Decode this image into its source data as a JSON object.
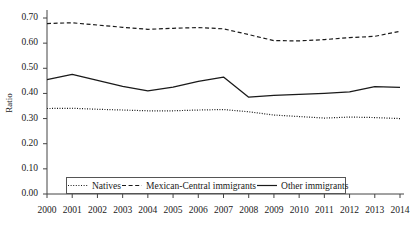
{
  "chart_data": {
    "type": "line",
    "title": "",
    "xlabel": "",
    "ylabel": "Ratio",
    "x": [
      2000,
      2001,
      2002,
      2003,
      2004,
      2005,
      2006,
      2007,
      2008,
      2009,
      2010,
      2011,
      2012,
      2013,
      2014
    ],
    "categories": [
      "2000",
      "2001",
      "2002",
      "2003",
      "2004",
      "2005",
      "2006",
      "2007",
      "2008",
      "2009",
      "2010",
      "2011",
      "2012",
      "2013",
      "2014"
    ],
    "xlim": [
      2000,
      2014
    ],
    "ylim": [
      0.0,
      0.7
    ],
    "yticks": [
      0.0,
      0.1,
      0.2,
      0.3,
      0.4,
      0.5,
      0.6,
      0.7
    ],
    "ytick_labels": [
      "0.00",
      "0.10",
      "0.20",
      "0.30",
      "0.40",
      "0.50",
      "0.60",
      "0.70"
    ],
    "grid": false,
    "legend_position": "bottom-inside",
    "series": [
      {
        "name": "Natives",
        "style": "dotted",
        "color": "#1a1a1a",
        "values": [
          0.34,
          0.341,
          0.337,
          0.334,
          0.331,
          0.331,
          0.334,
          0.336,
          0.327,
          0.314,
          0.308,
          0.302,
          0.306,
          0.304,
          0.3
        ]
      },
      {
        "name": "Mexican-Central immigrants",
        "style": "dashed",
        "color": "#1a1a1a",
        "values": [
          0.678,
          0.681,
          0.672,
          0.663,
          0.655,
          0.659,
          0.662,
          0.657,
          0.634,
          0.61,
          0.609,
          0.614,
          0.622,
          0.627,
          0.647
        ]
      },
      {
        "name": "Other immigrants",
        "style": "solid",
        "color": "#1a1a1a",
        "values": [
          0.455,
          0.476,
          0.452,
          0.428,
          0.41,
          0.425,
          0.448,
          0.465,
          0.385,
          0.392,
          0.396,
          0.4,
          0.406,
          0.427,
          0.424
        ]
      }
    ]
  },
  "legend": {
    "items": [
      {
        "label": "Natives",
        "style": "dotted"
      },
      {
        "label": "Mexican-Central immigrants",
        "style": "dashed"
      },
      {
        "label": "Other immigrants",
        "style": "solid"
      }
    ]
  }
}
